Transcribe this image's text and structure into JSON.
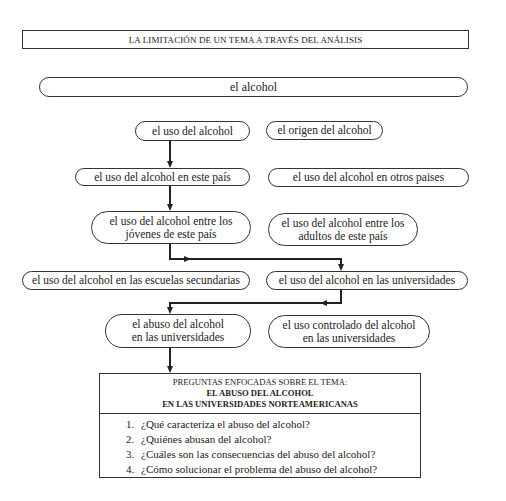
{
  "title": "LA LIMITACIÓN DE UN TEMA A TRAVÉS DEL ANÁLISIS",
  "nodes": {
    "root": "el alcohol",
    "level1_left": "el uso del alcohol",
    "level1_right": "el origen del alcohol",
    "level2_left": "el uso del alcohol en este país",
    "level2_right": "el uso del alcohol en otros paises",
    "level3_left_line1": "el uso del alcohol entre los",
    "level3_left_line2": "jóvenes de este país",
    "level3_right_line1": "el uso del alcohol entre los",
    "level3_right_line2": "adultos de este país",
    "level4_left": "el uso del alcohol en las escuelas secundarias",
    "level4_right": "el uso del alcohol en las universidades",
    "level5_left_line1": "el abuso del alcohol",
    "level5_left_line2": "en las universidades",
    "level5_right_line1": "el uso controlado del alcohol",
    "level5_right_line2": "en las universidades"
  },
  "questions_box": {
    "heading": "PREGUNTAS ENFOCADAS SOBRE EL TEMA:",
    "topic_line1": "EL ABUSO DEL ALCOHOL",
    "topic_line2": "EN LAS UNIVERSIDADES NORTEAMERICANAS",
    "questions": [
      {
        "num": "1.",
        "text": "¿Qué caracteriza el abuso del alcohol?"
      },
      {
        "num": "2.",
        "text": "¿Quiénes abusan del alcohol?"
      },
      {
        "num": "3.",
        "text": "¿Cuáles son las consecuencias del abuso del alcohol?"
      },
      {
        "num": "4.",
        "text": "¿Cómo solucionar el problema del abuso del alcohol?"
      }
    ]
  }
}
